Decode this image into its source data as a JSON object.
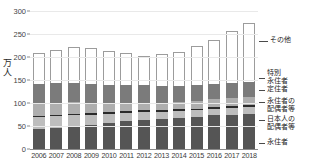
{
  "chart_data": {
    "type": "bar",
    "stacked": true,
    "title": "",
    "xlabel": "",
    "ylabel": "万人",
    "ylim": [
      0,
      300
    ],
    "yticks": [
      0,
      50,
      100,
      150,
      200,
      250,
      300
    ],
    "ytick_labels": [
      "0",
      "50",
      "100",
      "150",
      "200",
      "250",
      "300"
    ],
    "grid": true,
    "legend_position": "right",
    "categories": [
      "2006",
      "2007",
      "2008",
      "2009",
      "2010",
      "2011",
      "2012",
      "2013",
      "2014",
      "2015",
      "2016",
      "2017",
      "2018"
    ],
    "series": [
      {
        "name": "永住者",
        "color": "#555555",
        "values": [
          43,
          46,
          49,
          53,
          57,
          60,
          62,
          66,
          68,
          70,
          73,
          75,
          77
        ]
      },
      {
        "name": "日本人の配偶者等",
        "color": "#bdbdbd",
        "values": [
          26,
          25,
          24,
          22,
          20,
          19,
          18,
          15,
          14,
          14,
          14,
          14,
          14
        ]
      },
      {
        "name": "永住者の配偶者等",
        "color": "#2b2b2b",
        "values": [
          2,
          2,
          3,
          3,
          4,
          4,
          4,
          4,
          4,
          4,
          4,
          4,
          4
        ]
      },
      {
        "name": "定住者",
        "color": "#aeaeae",
        "values": [
          27,
          27,
          26,
          22,
          19,
          18,
          17,
          16,
          16,
          16,
          17,
          18,
          19
        ]
      },
      {
        "name": "特別永住者",
        "color": "#7b7b7b",
        "values": [
          44,
          43,
          42,
          41,
          40,
          39,
          38,
          37,
          36,
          35,
          34,
          33,
          32
        ]
      },
      {
        "name": "その他",
        "color": "#ffffff",
        "values": [
          67,
          72,
          78,
          78,
          73,
          68,
          64,
          69,
          74,
          84,
          96,
          112,
          127
        ]
      }
    ],
    "totals": [
      209,
      215,
      222,
      219,
      213,
      208,
      203,
      207,
      212,
      223,
      238,
      256,
      273
    ],
    "legend_entries": [
      {
        "label": "その他",
        "lines": [
          "その他"
        ],
        "color": "#ffffff"
      },
      {
        "label": "特別永住者",
        "lines": [
          "特別",
          "永住者"
        ],
        "color": "#7b7b7b"
      },
      {
        "label": "定住者",
        "lines": [
          "定住者"
        ],
        "color": "#aeaeae"
      },
      {
        "label": "永住者の配偶者等",
        "lines": [
          "永住者の",
          "配偶者等"
        ],
        "color": "#2b2b2b"
      },
      {
        "label": "日本人の配偶者等",
        "lines": [
          "日本人の",
          "配偶者等"
        ],
        "color": "#bdbdbd"
      },
      {
        "label": "永住者",
        "lines": [
          "永住者"
        ],
        "color": "#555555"
      }
    ],
    "yaxis_title_chars": [
      "万",
      "人"
    ]
  }
}
